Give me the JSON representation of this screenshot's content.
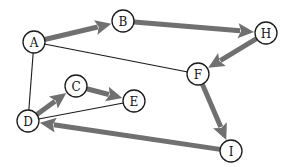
{
  "diagram": {
    "type": "directed-graph",
    "colors": {
      "background": "#ffffff",
      "node_fill": "#ffffff",
      "node_stroke": "#1a1a1a",
      "thick_edge": "#707070",
      "thin_edge": "#1a1a1a"
    },
    "node_radius": 11,
    "nodes": [
      {
        "id": "A",
        "label": "A",
        "x": 34,
        "y": 42
      },
      {
        "id": "B",
        "label": "B",
        "x": 123,
        "y": 21
      },
      {
        "id": "H",
        "label": "H",
        "x": 266,
        "y": 33
      },
      {
        "id": "F",
        "label": "F",
        "x": 198,
        "y": 74
      },
      {
        "id": "C",
        "label": "C",
        "x": 76,
        "y": 86
      },
      {
        "id": "E",
        "label": "E",
        "x": 134,
        "y": 101
      },
      {
        "id": "D",
        "label": "D",
        "x": 28,
        "y": 121
      },
      {
        "id": "I",
        "label": "I",
        "x": 231,
        "y": 151
      }
    ],
    "directed_edges": [
      {
        "from": "A",
        "to": "B"
      },
      {
        "from": "B",
        "to": "H"
      },
      {
        "from": "H",
        "to": "F"
      },
      {
        "from": "F",
        "to": "I"
      },
      {
        "from": "I",
        "to": "D"
      },
      {
        "from": "D",
        "to": "C"
      },
      {
        "from": "C",
        "to": "E"
      }
    ],
    "undirected_edges": [
      {
        "from": "A",
        "to": "F"
      },
      {
        "from": "A",
        "to": "D"
      },
      {
        "from": "D",
        "to": "E"
      }
    ]
  }
}
